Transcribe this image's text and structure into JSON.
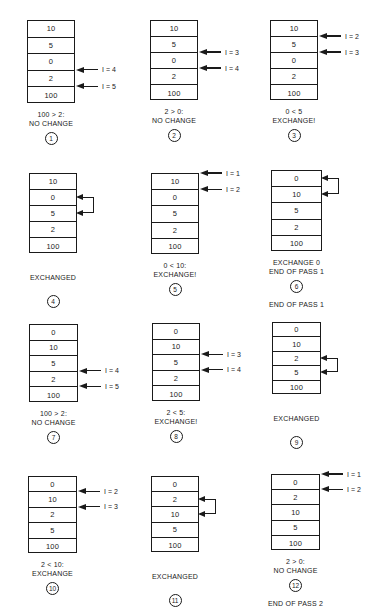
{
  "steps": [
    {
      "num": "1",
      "values": [
        "10",
        "5",
        "0",
        "2",
        "100"
      ],
      "pointers": [
        {
          "row": 3,
          "label": "I = 4"
        },
        {
          "row": 4,
          "label": "I = 5"
        }
      ],
      "swap": null,
      "caption": [
        "100 > 2:",
        "NO CHANGE"
      ],
      "note": ""
    },
    {
      "num": "2",
      "values": [
        "10",
        "5",
        "0",
        "2",
        "100"
      ],
      "pointers": [
        {
          "row": 2,
          "label": "I = 3"
        },
        {
          "row": 3,
          "label": "I = 4"
        }
      ],
      "swap": null,
      "caption": [
        "2 > 0:",
        "NO CHANGE"
      ],
      "note": ""
    },
    {
      "num": "3",
      "values": [
        "10",
        "5",
        "0",
        "2",
        "100"
      ],
      "pointers": [
        {
          "row": 1,
          "label": "I = 2"
        },
        {
          "row": 2,
          "label": "I = 3"
        }
      ],
      "swap": null,
      "caption": [
        "0 < 5",
        "EXCHANGE!"
      ],
      "note": ""
    },
    {
      "num": "4",
      "values": [
        "10",
        "0",
        "5",
        "2",
        "100"
      ],
      "pointers": [],
      "swap": [
        1,
        2
      ],
      "caption": [
        "EXCHANGED"
      ],
      "note": ""
    },
    {
      "num": "5",
      "values": [
        "10",
        "0",
        "5",
        "2",
        "100"
      ],
      "pointers": [
        {
          "row": 0,
          "label": "I = 1"
        },
        {
          "row": 1,
          "label": "I = 2"
        }
      ],
      "swap": null,
      "caption": [
        "0 < 10:",
        "EXCHANGE!"
      ],
      "note": ""
    },
    {
      "num": "6",
      "values": [
        "0",
        "10",
        "5",
        "2",
        "100"
      ],
      "pointers": [],
      "swap": [
        0,
        1
      ],
      "caption": [
        "EXCHANGE 0",
        "END OF PASS 1"
      ],
      "note": "END OF PASS 1"
    },
    {
      "num": "7",
      "values": [
        "0",
        "10",
        "5",
        "2",
        "100"
      ],
      "pointers": [
        {
          "row": 3,
          "label": "I = 4"
        },
        {
          "row": 4,
          "label": "I = 5"
        }
      ],
      "swap": null,
      "caption": [
        "100 > 2:",
        "NO CHANGE"
      ],
      "note": ""
    },
    {
      "num": "8",
      "values": [
        "0",
        "10",
        "5",
        "2",
        "100"
      ],
      "pointers": [
        {
          "row": 2,
          "label": "I = 3"
        },
        {
          "row": 3,
          "label": "I = 4"
        }
      ],
      "swap": null,
      "caption": [
        "2 < 5:",
        "EXCHANGE!"
      ],
      "note": ""
    },
    {
      "num": "9",
      "values": [
        "0",
        "10",
        "2",
        "5",
        "100"
      ],
      "pointers": [],
      "swap": [
        2,
        3
      ],
      "caption": [
        "EXCHANGED"
      ],
      "note": ""
    },
    {
      "num": "10",
      "values": [
        "0",
        "10",
        "2",
        "5",
        "100"
      ],
      "pointers": [
        {
          "row": 1,
          "label": "I = 2"
        },
        {
          "row": 2,
          "label": "I = 3"
        }
      ],
      "swap": null,
      "caption": [
        "2 < 10:",
        "EXCHANGE"
      ],
      "note": ""
    },
    {
      "num": "11",
      "values": [
        "0",
        "2",
        "10",
        "5",
        "100"
      ],
      "pointers": [],
      "swap": [
        1,
        2
      ],
      "caption": [
        "EXCHANGED"
      ],
      "note": ""
    },
    {
      "num": "12",
      "values": [
        "0",
        "2",
        "10",
        "5",
        "100"
      ],
      "pointers": [
        {
          "row": 0,
          "label": "I = 1"
        },
        {
          "row": 1,
          "label": "I = 2"
        }
      ],
      "swap": null,
      "caption": [
        "2 > 0:",
        "NO CHANGE"
      ],
      "note": "END OF PASS 2"
    }
  ],
  "layout": {
    "stack_boxes": [
      {
        "x": 27,
        "y": 20,
        "w": 48,
        "h": 83
      },
      {
        "x": 150,
        "y": 20,
        "w": 48,
        "h": 80
      },
      {
        "x": 270,
        "y": 20,
        "w": 48,
        "h": 80
      },
      {
        "x": 29,
        "y": 173,
        "w": 48,
        "h": 80
      },
      {
        "x": 151,
        "y": 173,
        "w": 48,
        "h": 81
      },
      {
        "x": 271,
        "y": 170,
        "w": 51,
        "h": 81
      },
      {
        "x": 29,
        "y": 324,
        "w": 49,
        "h": 78
      },
      {
        "x": 152,
        "y": 323,
        "w": 48,
        "h": 78
      },
      {
        "x": 272,
        "y": 322,
        "w": 49,
        "h": 72
      },
      {
        "x": 28,
        "y": 476,
        "w": 49,
        "h": 77
      },
      {
        "x": 151,
        "y": 476,
        "w": 48,
        "h": 76
      },
      {
        "x": 271,
        "y": 474,
        "w": 49,
        "h": 76
      }
    ]
  }
}
